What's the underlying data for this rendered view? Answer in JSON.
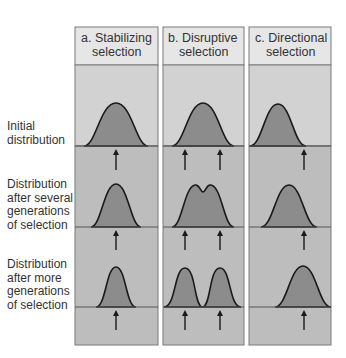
{
  "figure": {
    "panels": [
      {
        "id": "a",
        "title_line1": "a. Stabilizing",
        "title_line2": "selection"
      },
      {
        "id": "b",
        "title_line1": "b. Disruptive",
        "title_line2": "selection"
      },
      {
        "id": "c",
        "title_line1": "c. Directional",
        "title_line2": "selection"
      }
    ],
    "row_labels": [
      {
        "lines": [
          "Initial",
          "distribution"
        ]
      },
      {
        "lines": [
          "Distribution",
          "after several",
          "generations",
          "of selection"
        ]
      },
      {
        "lines": [
          "Distribution",
          "after more",
          "generations",
          "of selection"
        ]
      }
    ],
    "colors": {
      "header_bg": "#e6e6e6",
      "upper_bg": "#d2d2d2",
      "lower_bg": "#bdbdbd",
      "curve_fill": "#8c8c8c",
      "curve_stroke": "#1a1a1a",
      "border": "#7a7a7a",
      "arrow": "#1a1a1a"
    }
  }
}
